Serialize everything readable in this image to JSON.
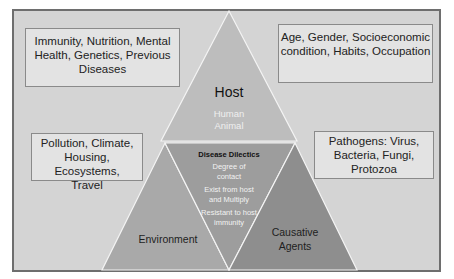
{
  "diagram": {
    "title": "Disease Dilectics",
    "host": {
      "label": "Host",
      "examples": [
        "Human",
        "Animal"
      ]
    },
    "environment": {
      "label": "Environment"
    },
    "agents": {
      "label_line1": "Causative",
      "label_line2": "Agents"
    },
    "center": {
      "title": "Disease Dilectics",
      "items": [
        {
          "line1": "Degree of",
          "line2": "contact"
        },
        {
          "line1": "Exist from host",
          "line2": "and Multiply"
        },
        {
          "line1": "Resistant to host",
          "line2": "immunity"
        }
      ]
    },
    "boxes": {
      "top_left": {
        "lines": [
          "Immunity, Nutrition, Mental",
          "Health, Genetics, Previous",
          "Diseases"
        ]
      },
      "top_right": {
        "lines": [
          "Age, Gender, Socioeconomic",
          "condition, Habits, Occupation"
        ]
      },
      "mid_left": {
        "lines": [
          "Pollution, Climate,",
          "Housing, Ecosystems,",
          "Travel"
        ]
      },
      "mid_right": {
        "lines": [
          "Pathogens: Virus,",
          "Bacteria, Fungi,",
          "Protozoa"
        ]
      }
    },
    "colors": {
      "background": "#d4d4d4",
      "host_triangle": "#bdbdbd",
      "environment_triangle": "#a9a9a9",
      "center_triangle": "#9c9c9c",
      "agents_triangle": "#8f8f8f",
      "box_fill": "#e3e3e3",
      "frame_border": "#6e6e6e"
    }
  }
}
